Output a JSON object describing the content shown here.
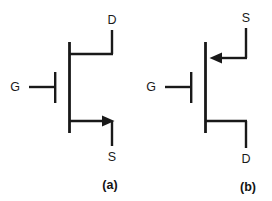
{
  "figure": {
    "background_color": "#ffffff",
    "line_color": "#191919",
    "width": 272,
    "height": 201
  },
  "diagrams": [
    {
      "id": "a",
      "caption": "(a)",
      "type": "n-channel-jfet",
      "terminals": {
        "gate": "G",
        "drain": "D",
        "source": "S"
      },
      "arrow_direction": "right-outward",
      "terminal_positions": {
        "drain": "top",
        "source": "bottom",
        "gate": "left"
      }
    },
    {
      "id": "b",
      "caption": "(b)",
      "type": "p-channel-jfet",
      "terminals": {
        "gate": "G",
        "drain": "D",
        "source": "S"
      },
      "arrow_direction": "left-inward",
      "terminal_positions": {
        "source": "top",
        "drain": "bottom",
        "gate": "left"
      }
    }
  ]
}
